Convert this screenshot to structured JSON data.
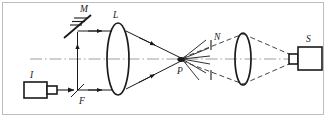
{
  "figure": {
    "kind": "optical-ray-diagram",
    "title": "",
    "width": 326,
    "height": 117,
    "background_color": "#ffffff",
    "frame_color": "#b9b9b9",
    "ink_color": "#1a1a1a",
    "axis_color": "#9a9a9a",
    "ray_color": "#2a2a2a",
    "dashed_ray_color": "#3a3a3a"
  },
  "labels": {
    "source": "I",
    "beamsplitter": "F",
    "mirror": "M",
    "lens_first": "L",
    "focus_point": "P",
    "aperture": "N",
    "detector": "S"
  },
  "components": [
    {
      "id": "source",
      "data_name": "light-source-I",
      "label": "I",
      "shape": "box-with-nozzle",
      "x": 24,
      "y": 82,
      "width": 24,
      "height": 17
    },
    {
      "id": "beamsplitter",
      "data_name": "beamsplitter-F",
      "label": "F",
      "shape": "diagonal-line",
      "x": 76,
      "y": 91
    },
    {
      "id": "mirror",
      "data_name": "mirror-M",
      "label": "M",
      "shape": "hatched-diagonal-mirror",
      "x": 76,
      "y": 26,
      "hatch_count": 3
    },
    {
      "id": "lens_first",
      "data_name": "lens-L",
      "label": "L",
      "shape": "ellipse-lens",
      "cx": 118,
      "cy": 58,
      "rx": 11,
      "ry": 36
    },
    {
      "id": "focus_point",
      "data_name": "focus-point-P",
      "label": "P",
      "shape": "point",
      "cx": 182,
      "cy": 59
    },
    {
      "id": "aperture",
      "data_name": "aperture-N",
      "label": "N",
      "shape": "two-vertical-ticks",
      "x": 211,
      "y_top": 40,
      "y_bottom": 78
    },
    {
      "id": "lens_second",
      "data_name": "lens-second",
      "label": "",
      "shape": "ellipse-lens",
      "cx": 243,
      "cy": 59,
      "rx": 8,
      "ry": 26
    },
    {
      "id": "detector",
      "data_name": "detector-S",
      "label": "S",
      "shape": "box-with-nozzle",
      "x": 296,
      "y": 48,
      "width": 26,
      "height": 22
    }
  ],
  "rays": {
    "solid_beams": [
      "source-to-beamsplitter",
      "beamsplitter-up-to-mirror",
      "mirror-right-to-lens-top",
      "beamsplitter-right-to-lens-bottom",
      "lens-top-converging-to-P",
      "lens-bottom-converging-to-P"
    ],
    "dashed_beams": [
      "P-to-lens-second-upper",
      "P-to-lens-second-lower",
      "lens-second-to-detector-upper",
      "lens-second-to-detector-lower"
    ],
    "scatter_rays_at_P": 6,
    "axis_style": "dash-dot"
  }
}
